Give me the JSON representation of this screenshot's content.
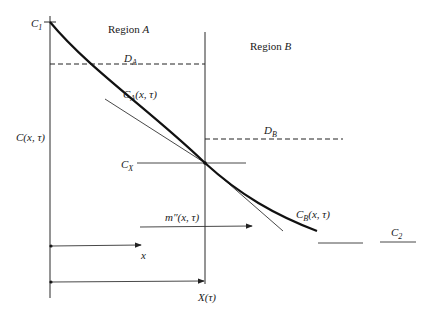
{
  "diagram": {
    "regions": {
      "a": {
        "prefix": "Region ",
        "name": "A"
      },
      "b": {
        "prefix": "Region ",
        "name": "B"
      }
    },
    "labels": {
      "c1": {
        "main": "C",
        "sub": "1"
      },
      "c2": {
        "main": "C",
        "sub": "2"
      },
      "cx": {
        "main": "C",
        "sub": "X"
      },
      "da": {
        "main": "D",
        "sub": "A"
      },
      "db": {
        "main": "D",
        "sub": "B"
      },
      "ca": {
        "main": "C",
        "sub": "A",
        "args": "(x, τ)"
      },
      "cb": {
        "main": "C",
        "sub": "B",
        "args": "(x, τ)"
      },
      "c_axis": "C(x, τ)",
      "flux": "m″(x, τ)",
      "x_arrow": "x",
      "interface": "X(τ)"
    }
  }
}
